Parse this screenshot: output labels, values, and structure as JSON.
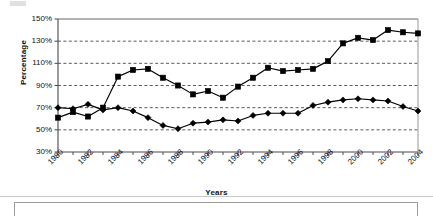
{
  "chart_data": {
    "type": "line",
    "title": "",
    "xlabel": "Years",
    "ylabel": "Percentage",
    "ylim": [
      30,
      150
    ],
    "xlim": [
      1980,
      2004
    ],
    "ytick_labels": [
      "150%",
      "130%",
      "110%",
      "90%",
      "70%",
      "50%",
      "30%"
    ],
    "ytick_values": [
      150,
      130,
      110,
      90,
      70,
      50,
      30
    ],
    "ytick_step": 20,
    "grid": true,
    "grid_style": "dashed-horizontal",
    "legend": "none",
    "x": [
      1980,
      1981,
      1982,
      1983,
      1984,
      1985,
      1986,
      1987,
      1988,
      1989,
      1990,
      1991,
      1992,
      1993,
      1994,
      1995,
      1996,
      1997,
      1998,
      1999,
      2000,
      2001,
      2002,
      2003,
      2004
    ],
    "xtick_labels": [
      "1980",
      "1982",
      "1984",
      "1986",
      "1988",
      "1990",
      "1992",
      "1994",
      "1996",
      "1998",
      "2000",
      "2002",
      "2004"
    ],
    "xtick_values": [
      1980,
      1982,
      1984,
      1986,
      1988,
      1990,
      1992,
      1994,
      1996,
      1998,
      2000,
      2002,
      2004
    ],
    "series": [
      {
        "name": "Series 1",
        "marker": "square",
        "color": "#000000",
        "values": [
          61,
          66,
          62,
          70,
          98,
          104,
          105,
          97,
          90,
          82,
          85,
          79,
          89,
          97,
          106,
          103,
          104,
          105,
          112,
          128,
          133,
          131,
          140,
          138,
          137
        ]
      },
      {
        "name": "Series 2",
        "marker": "diamond",
        "color": "#000000",
        "values": [
          70,
          69,
          73,
          68,
          70,
          67,
          61,
          54,
          51,
          56,
          57,
          59,
          58,
          63,
          65,
          65,
          65,
          72,
          75,
          77,
          78,
          77,
          76,
          71,
          67
        ]
      }
    ]
  },
  "figure": {
    "plot_left": 58,
    "plot_right": 418,
    "plot_top": 19,
    "plot_bottom": 152
  }
}
